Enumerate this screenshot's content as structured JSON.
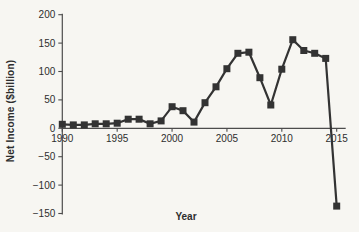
{
  "figure": {
    "background": "#f7f6f2",
    "ink": "#333333",
    "axis_color": "#4c4c4c",
    "tick_label_color": "#2e2e2e"
  },
  "chart_data": {
    "type": "line",
    "title": "",
    "xlabel": "Year",
    "ylabel": "Net Income ($billion)",
    "x": [
      1990,
      1991,
      1992,
      1993,
      1994,
      1995,
      1996,
      1997,
      1998,
      1999,
      2000,
      2001,
      2002,
      2003,
      2004,
      2005,
      2006,
      2007,
      2008,
      2009,
      2010,
      2011,
      2012,
      2013,
      2014,
      2015
    ],
    "values": [
      7,
      6,
      6,
      8,
      8,
      9,
      16,
      16,
      8,
      13,
      38,
      31,
      11,
      45,
      73,
      105,
      132,
      134,
      89,
      41,
      104,
      156,
      137,
      132,
      123,
      -137
    ],
    "series_name": "Net Income",
    "xticks": [
      1990,
      1995,
      2000,
      2005,
      2010,
      2015
    ],
    "yticks": [
      200,
      150,
      100,
      50,
      0,
      -50,
      -100,
      -150
    ],
    "xlim": [
      1990,
      2015
    ],
    "ylim": [
      -150,
      200
    ],
    "grid": false,
    "legend": "none",
    "marker": "filled-square",
    "marker_size": 7,
    "line_width": 2.2,
    "line_color": "#333333",
    "marker_color": "#333333"
  }
}
